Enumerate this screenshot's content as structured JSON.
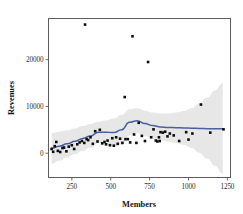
{
  "chart_data": {
    "type": "scatter",
    "title": "",
    "xlabel": "Members",
    "ylabel": "Revenues",
    "xlim": [
      100,
      1270
    ],
    "ylim": [
      -5200,
      28800
    ],
    "grid": false,
    "legend": null,
    "xticks": [
      250,
      500,
      750,
      1000,
      1250
    ],
    "xtick_labels": [
      "250",
      "500",
      "750",
      "1000",
      "1250"
    ],
    "yticks": [
      0,
      10000,
      20000
    ],
    "ytick_labels": [
      "0",
      "10000",
      "20000"
    ],
    "marker": "filled-square",
    "marker_color": "#0d0d0d",
    "smoother": {
      "type": "loess",
      "line_color": "#4a5f9e",
      "band_color": "#d9d9d9",
      "band_label": "confidence interval",
      "x": [
        120,
        170,
        220,
        270,
        320,
        370,
        420,
        470,
        520,
        570,
        620,
        670,
        720,
        770,
        820,
        870,
        920,
        970,
        1020,
        1070,
        1120,
        1170,
        1220
      ],
      "y": [
        1050,
        1500,
        2000,
        2550,
        3150,
        3700,
        4450,
        4500,
        4400,
        5000,
        6600,
        6950,
        6350,
        5900,
        5600,
        5500,
        5450,
        5400,
        5350,
        5300,
        5250,
        5200,
        5200
      ],
      "y_upper": [
        4300,
        4600,
        4900,
        5300,
        5800,
        6200,
        6700,
        7000,
        7400,
        8200,
        9400,
        9600,
        9100,
        8700,
        8500,
        8500,
        8700,
        9000,
        9600,
        10600,
        11900,
        13400,
        15000
      ],
      "y_lower": [
        -2200,
        -1600,
        -900,
        -200,
        500,
        1200,
        2200,
        2000,
        1400,
        1800,
        3800,
        4300,
        3600,
        3100,
        2700,
        2500,
        2200,
        1800,
        1100,
        100,
        -1200,
        -2700,
        -4400
      ]
    },
    "points": [
      {
        "x": 120,
        "y": 900
      },
      {
        "x": 130,
        "y": 300
      },
      {
        "x": 140,
        "y": 1500
      },
      {
        "x": 150,
        "y": 2400
      },
      {
        "x": 160,
        "y": 500
      },
      {
        "x": 175,
        "y": 250
      },
      {
        "x": 190,
        "y": 1100
      },
      {
        "x": 200,
        "y": 1200
      },
      {
        "x": 215,
        "y": 400
      },
      {
        "x": 230,
        "y": 1400
      },
      {
        "x": 250,
        "y": 1700
      },
      {
        "x": 265,
        "y": 900
      },
      {
        "x": 285,
        "y": 1900
      },
      {
        "x": 300,
        "y": 2300
      },
      {
        "x": 315,
        "y": 2600
      },
      {
        "x": 330,
        "y": 2200
      },
      {
        "x": 335,
        "y": 27500
      },
      {
        "x": 345,
        "y": 3000
      },
      {
        "x": 355,
        "y": 2800
      },
      {
        "x": 370,
        "y": 3400
      },
      {
        "x": 385,
        "y": 2000
      },
      {
        "x": 400,
        "y": 4700
      },
      {
        "x": 415,
        "y": 2500
      },
      {
        "x": 430,
        "y": 5000
      },
      {
        "x": 445,
        "y": 2100
      },
      {
        "x": 460,
        "y": 2400
      },
      {
        "x": 470,
        "y": 1900
      },
      {
        "x": 480,
        "y": 2700
      },
      {
        "x": 495,
        "y": 1700
      },
      {
        "x": 510,
        "y": 3200
      },
      {
        "x": 520,
        "y": 1600
      },
      {
        "x": 535,
        "y": 3400
      },
      {
        "x": 545,
        "y": 2000
      },
      {
        "x": 560,
        "y": 3100
      },
      {
        "x": 575,
        "y": 2200
      },
      {
        "x": 590,
        "y": 12000
      },
      {
        "x": 595,
        "y": 3000
      },
      {
        "x": 610,
        "y": 3000
      },
      {
        "x": 625,
        "y": 2300
      },
      {
        "x": 640,
        "y": 25000
      },
      {
        "x": 650,
        "y": 4000
      },
      {
        "x": 665,
        "y": 2200
      },
      {
        "x": 680,
        "y": 6500
      },
      {
        "x": 700,
        "y": 3700
      },
      {
        "x": 720,
        "y": 2600
      },
      {
        "x": 740,
        "y": 19500
      },
      {
        "x": 760,
        "y": 3400
      },
      {
        "x": 775,
        "y": 5100
      },
      {
        "x": 790,
        "y": 2700
      },
      {
        "x": 800,
        "y": 2500
      },
      {
        "x": 810,
        "y": 3400
      },
      {
        "x": 815,
        "y": 2600
      },
      {
        "x": 820,
        "y": 4500
      },
      {
        "x": 835,
        "y": 4400
      },
      {
        "x": 850,
        "y": 4600
      },
      {
        "x": 865,
        "y": 3600
      },
      {
        "x": 880,
        "y": 4200
      },
      {
        "x": 905,
        "y": 3800
      },
      {
        "x": 940,
        "y": 2600
      },
      {
        "x": 985,
        "y": 4500
      },
      {
        "x": 1000,
        "y": 2900
      },
      {
        "x": 1025,
        "y": 4200
      },
      {
        "x": 1080,
        "y": 10400
      },
      {
        "x": 1140,
        "y": 4400
      },
      {
        "x": 1225,
        "y": 5100
      }
    ]
  }
}
